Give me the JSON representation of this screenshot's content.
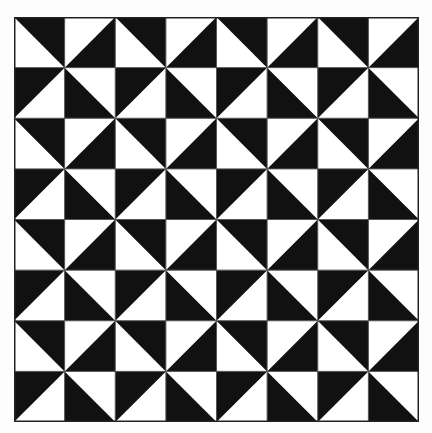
{
  "figure": {
    "type": "pinwheel-triangle-tiling",
    "rows": 8,
    "cols": 8,
    "colors": {
      "dark": "#111111",
      "light": "#ffffff",
      "grid_line": "#555555",
      "border": "#222222"
    },
    "row_patterns": {
      "even": [
        "TR",
        "BR",
        "TR",
        "BR",
        "TR",
        "BR",
        "TR",
        "BR"
      ],
      "odd": [
        "TL",
        "BL",
        "TL",
        "BL",
        "TL",
        "BL",
        "TL",
        "BL"
      ]
    },
    "legend": {
      "TR": "diagonal top-left to bottom-right, dark upper-right half",
      "BR": "diagonal bottom-left to top-right, dark lower-right half",
      "TL": "diagonal bottom-left to top-right, dark upper-left half",
      "BL": "diagonal top-left to bottom-right, dark lower-left half"
    }
  }
}
